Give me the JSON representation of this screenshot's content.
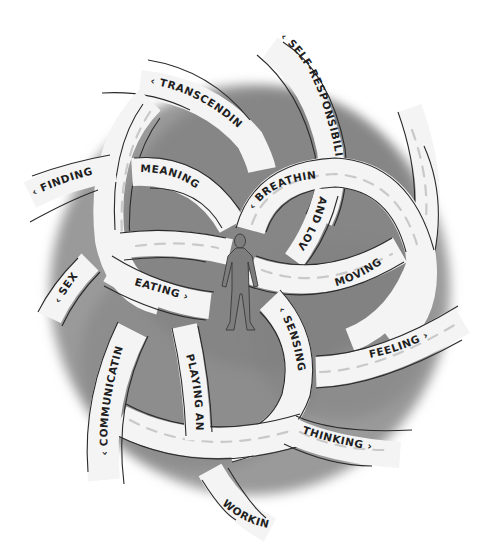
{
  "diagram": {
    "type": "illustration",
    "colors": {
      "background": "#ffffff",
      "wash": "#8a8a8a",
      "wash_dark": "#6f6f6f",
      "ribbon": "#f4f4f4",
      "outline": "#2a2a2a",
      "figure": "#7d7d7d",
      "text": "#1e1e1e"
    },
    "center_figure": "human-figure",
    "labels": {
      "self_responsibility": "‹ SELF-RESPONSIBILITY",
      "transcending": "‹ TRANSCENDING",
      "finding": "‹ FINDING",
      "meaning": "MEANING",
      "breathing": "‹ BREATHING",
      "and_love": "AND LOVE",
      "moving": "MOVING ›",
      "sex": "‹ SEX",
      "eating": "EATING ›",
      "sensing": "‹ SENSING",
      "feeling": "FEELING ›",
      "communicating": "‹ COMMUNICATING",
      "playing_and": "PLAYING AND",
      "thinking": "THINKING ›",
      "working": "WORKING ›"
    }
  }
}
